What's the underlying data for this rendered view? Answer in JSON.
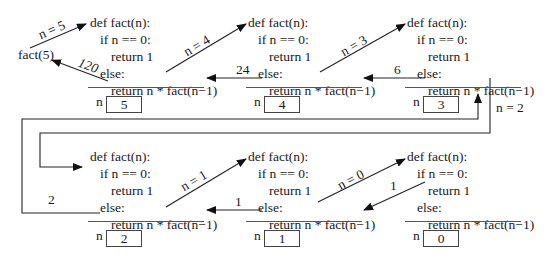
{
  "call_expression": "fact(5)",
  "code_lines": [
    "def fact(n):",
    "if n == 0:",
    "return 1",
    "else:",
    "return n * fact(n−1)"
  ],
  "frames": [
    {
      "n_label": "n",
      "n_value": "5"
    },
    {
      "n_label": "n",
      "n_value": "4"
    },
    {
      "n_label": "n",
      "n_value": "3"
    },
    {
      "n_label": "n",
      "n_value": "2"
    },
    {
      "n_label": "n",
      "n_value": "1"
    },
    {
      "n_label": "n",
      "n_value": "0"
    }
  ],
  "call_arrows": [
    "n = 5",
    "n = 4",
    "n = 3",
    "n = 2",
    "n = 1",
    "n = 0"
  ],
  "return_arrows": [
    "120",
    "24",
    "6",
    "2",
    "1",
    "1"
  ]
}
